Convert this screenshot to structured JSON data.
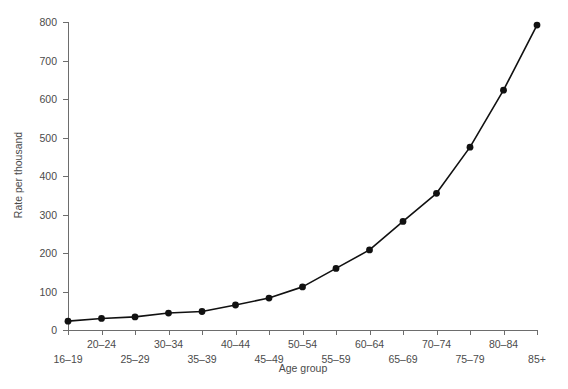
{
  "chart_data": {
    "type": "line",
    "title": "",
    "subtitle": "",
    "xlabel": "Age group",
    "ylabel": "Rate per thousand",
    "categories": [
      "16–19",
      "20–24",
      "25–29",
      "30–34",
      "35–39",
      "40–44",
      "45–49",
      "50–54",
      "55–59",
      "60–64",
      "65–69",
      "70–74",
      "75–79",
      "80–84",
      "85+"
    ],
    "values": [
      23,
      30,
      34,
      44,
      48,
      65,
      83,
      112,
      160,
      208,
      282,
      355,
      475,
      623,
      792
    ],
    "series": [
      {
        "name": "Rate per thousand",
        "values": [
          23,
          30,
          34,
          44,
          48,
          65,
          83,
          112,
          160,
          208,
          282,
          355,
          475,
          623,
          792
        ]
      }
    ],
    "ylim": [
      0,
      800
    ],
    "yticks": [
      0,
      100,
      200,
      300,
      400,
      500,
      600,
      700,
      800
    ],
    "ytick_labels": [
      "0",
      "100",
      "200",
      "300",
      "400",
      "500",
      "600",
      "700",
      "800"
    ],
    "grid": false,
    "legend": false,
    "legend_position": "none",
    "marker": "circle",
    "line_color": "#111111",
    "marker_color": "#111111",
    "axis_color": "#6d6d6d",
    "text_color": "#4b4b4b",
    "background": "#ffffff",
    "xtick_label_rows": 2,
    "annotations": []
  }
}
